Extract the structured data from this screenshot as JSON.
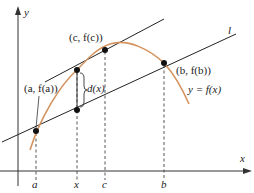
{
  "diagram": {
    "colors": {
      "curve": "#d4935e",
      "lines": "#222222",
      "axes": "#333333",
      "points": "#111111"
    },
    "axes": {
      "x_label": "x",
      "y_label": "y"
    },
    "tick_labels": {
      "a": "a",
      "x": "x",
      "c": "c",
      "b": "b"
    },
    "point_labels": {
      "a_point": "(a, f(a))",
      "c_point": "(c, f(c))",
      "b_point": "(b, f(b))"
    },
    "annotations": {
      "distance": "d(x)",
      "secant_line": "l",
      "function": "y = f(x)"
    }
  }
}
